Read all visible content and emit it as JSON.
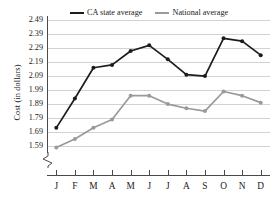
{
  "chart_data": {
    "type": "line",
    "title": "",
    "xlabel": "",
    "ylabel": "Cost (in dollars)",
    "categories": [
      "J",
      "F",
      "M",
      "A",
      "M",
      "J",
      "J",
      "A",
      "S",
      "O",
      "N",
      "D"
    ],
    "ylim": [
      1.54,
      2.52
    ],
    "yticks": [
      "2.49",
      "2.39",
      "2.29",
      "2.19",
      "2.09",
      "1.99",
      "1.89",
      "1.79",
      "1.69",
      "1.59"
    ],
    "ytick_values": [
      2.49,
      2.39,
      2.29,
      2.19,
      2.09,
      1.99,
      1.89,
      1.79,
      1.69,
      1.59
    ],
    "grid": true,
    "axis_break": true,
    "legend_position": "top",
    "series": [
      {
        "name": "CA state average",
        "color": "#1c1c1c",
        "values": [
          1.72,
          1.93,
          2.15,
          2.17,
          2.27,
          2.31,
          2.21,
          2.1,
          2.09,
          2.36,
          2.34,
          2.24
        ]
      },
      {
        "name": "National average",
        "color": "#9a9a9a",
        "values": [
          1.58,
          1.64,
          1.72,
          1.78,
          1.95,
          1.95,
          1.89,
          1.86,
          1.84,
          1.98,
          1.95,
          1.9
        ]
      }
    ]
  },
  "legend": {
    "items": [
      {
        "label": "CA state average"
      },
      {
        "label": "National average"
      }
    ]
  }
}
